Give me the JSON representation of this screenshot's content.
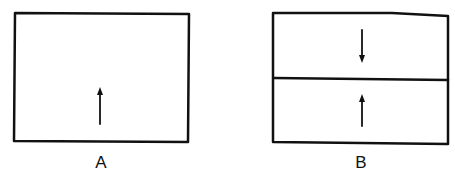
{
  "diagram": {
    "panels": [
      {
        "id": "A",
        "label": "A",
        "compartments": 1,
        "arrows": [
          {
            "direction": "up",
            "compartment": "single"
          }
        ]
      },
      {
        "id": "B",
        "label": "B",
        "compartments": 2,
        "arrows": [
          {
            "direction": "down",
            "compartment": "top"
          },
          {
            "direction": "up",
            "compartment": "bottom"
          }
        ]
      }
    ],
    "stroke_color": "#111111",
    "background": "#ffffff"
  }
}
